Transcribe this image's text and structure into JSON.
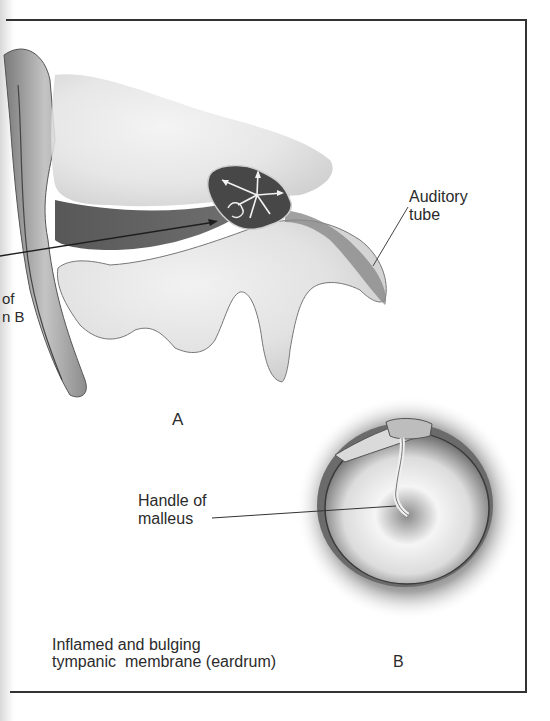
{
  "figure": {
    "panel_a": {
      "label": "A",
      "callouts": {
        "auditory_tube_line1": "Auditory",
        "auditory_tube_line2": "tube",
        "cropped_left_line1": "of",
        "cropped_left_line2": "n B"
      }
    },
    "panel_b": {
      "label": "B",
      "callouts": {
        "handle_line1": "Handle of",
        "handle_line2": "malleus"
      },
      "caption_line1": "Inflamed and bulging",
      "caption_line2": "tympanic  membrane (eardrum)"
    },
    "colors": {
      "ink": "#2b2b2b",
      "frame": "#333333",
      "tissue_light": "#e6e6e6",
      "tissue_mid": "#b5b5b5",
      "cavity_dark": "#4a4a4a"
    }
  }
}
